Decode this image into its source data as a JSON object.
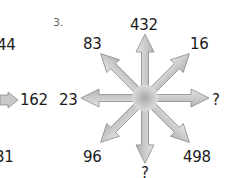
{
  "puzzle": {
    "number": "3.",
    "center": {
      "x": 145,
      "y": 98
    },
    "arrow_fill": "#c8c8c8",
    "arrow_stroke": "#8a8a8a",
    "labels": {
      "top": "432",
      "top_left": "83",
      "top_right": "16",
      "left": "23",
      "right": "?",
      "bottom_left": "96",
      "bottom_right": "498",
      "bottom": "?"
    }
  },
  "previous_puzzle_partial": {
    "top_left": "44",
    "right": "162",
    "bottom_left": "31"
  }
}
